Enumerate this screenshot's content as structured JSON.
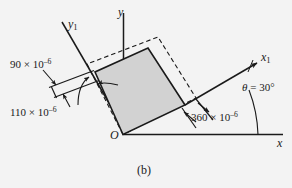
{
  "figure": {
    "caption": "(b)",
    "background_color": "#f3f3f3",
    "line_color": "#1a1a1a",
    "shaded_fill_color": "#d2d2d2",
    "axes": {
      "x": {
        "label": "x"
      },
      "y": {
        "label": "y"
      },
      "x1": {
        "label_base": "x",
        "label_sub": "1"
      },
      "y1": {
        "label_base": "y",
        "label_sub": "1"
      },
      "origin": {
        "label": "O"
      }
    },
    "angle": {
      "symbol": "θ",
      "equals": "=",
      "value": "30°",
      "text": "θ = 30°"
    },
    "strains": [
      {
        "name": "shear-strain-top-left",
        "mantissa": "90",
        "times": "×",
        "base": "10",
        "exponent": "–6",
        "text": "90 × 10–6"
      },
      {
        "name": "normal-strain-y1",
        "mantissa": "110",
        "times": "×",
        "base": "10",
        "exponent": "–6",
        "text": "110 × 10–6"
      },
      {
        "name": "normal-strain-x1",
        "mantissa": "360",
        "times": "×",
        "base": "10",
        "exponent": "–6",
        "text": "360 × 10–6"
      }
    ]
  }
}
